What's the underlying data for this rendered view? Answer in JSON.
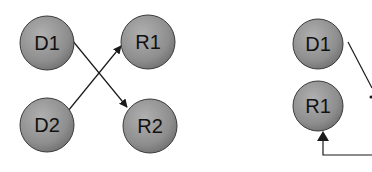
{
  "colors": {
    "node_fill_light": "#a8a8a8",
    "node_fill_dark": "#7c7c7c",
    "node_stroke": "#3a3a3a",
    "edge": "#1a1a1a",
    "background": "#ffffff"
  },
  "left_panel": {
    "nodes": [
      {
        "id": "D1",
        "label": "D1"
      },
      {
        "id": "R1",
        "label": "R1"
      },
      {
        "id": "D2",
        "label": "D2"
      },
      {
        "id": "R2",
        "label": "R2"
      }
    ],
    "edges": [
      {
        "from": "D1",
        "to": "R2"
      },
      {
        "from": "D2",
        "to": "R1"
      }
    ]
  },
  "right_panel": {
    "nodes": [
      {
        "id": "D1",
        "label": "D1"
      },
      {
        "id": "R1",
        "label": "R1"
      }
    ],
    "edges": [
      {
        "from": "D1",
        "to": "offscreen-right"
      },
      {
        "from": "offscreen-right",
        "to": "R1"
      }
    ]
  }
}
